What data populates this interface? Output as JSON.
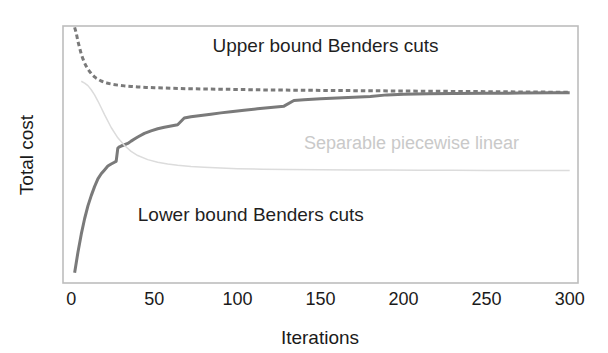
{
  "chart_data": {
    "type": "line",
    "title": "",
    "xlabel": "Iterations",
    "ylabel": "Total cost",
    "xlim": [
      -5,
      305
    ],
    "ylim": [
      0,
      100
    ],
    "xticks": [
      0,
      50,
      100,
      150,
      200,
      250,
      300
    ],
    "xtick_labels": [
      "0",
      "50",
      "100",
      "150",
      "200",
      "250",
      "300"
    ],
    "yticks": [],
    "ytick_labels": [],
    "grid": false,
    "legend": "none (inline annotations)",
    "frame": "box border, light gray",
    "annotations": [
      {
        "text": "Upper bound Benders cuts",
        "x": 85,
        "y": 90,
        "color": "#1f1f1f",
        "style": "dark"
      },
      {
        "text": "Separable piecewise linear",
        "x": 140,
        "y": 52,
        "color": "#c9c9c9",
        "style": "light"
      },
      {
        "text": "Lower bound Benders cuts",
        "x": 40,
        "y": 24,
        "color": "#1f1f1f",
        "style": "dark"
      }
    ],
    "series": [
      {
        "name": "Upper bound Benders cuts",
        "linestyle": "dashed",
        "color": "#7a7a7a",
        "linewidth": 3,
        "x": [
          2,
          3,
          4,
          5,
          6,
          7,
          8,
          9,
          10,
          11,
          12,
          13,
          14,
          15,
          16,
          18,
          20,
          22,
          25,
          28,
          32,
          36,
          40,
          45,
          50,
          60,
          70,
          80,
          90,
          100,
          120,
          140,
          160,
          180,
          200,
          220,
          240,
          260,
          280,
          300
        ],
        "y": [
          99.5,
          97.2,
          94.0,
          91.5,
          89.0,
          87.2,
          85.6,
          84.3,
          83.2,
          82.3,
          81.5,
          80.8,
          80.2,
          79.7,
          79.3,
          78.6,
          78.1,
          77.7,
          77.3,
          77.0,
          76.7,
          76.5,
          76.3,
          76.1,
          76.0,
          75.8,
          75.6,
          75.5,
          75.4,
          75.3,
          75.1,
          75.0,
          74.9,
          74.8,
          74.7,
          74.6,
          74.5,
          74.4,
          74.3,
          74.2
        ]
      },
      {
        "name": "Lower bound Benders cuts",
        "linestyle": "solid",
        "color": "#7a7a7a",
        "linewidth": 3,
        "x": [
          2,
          4,
          6,
          8,
          10,
          12,
          14,
          16,
          18,
          20,
          22,
          24,
          26,
          27,
          28,
          29,
          30,
          32,
          34,
          36,
          38,
          40,
          44,
          48,
          52,
          56,
          60,
          64,
          68,
          72,
          78,
          84,
          90,
          96,
          104,
          112,
          120,
          128,
          134,
          140,
          150,
          160,
          170,
          180,
          190,
          200,
          215,
          230,
          250,
          270,
          290,
          300
        ],
        "y": [
          4.0,
          12.0,
          19.0,
          25.0,
          30.0,
          34.0,
          37.5,
          40.5,
          42.5,
          44.0,
          45.5,
          46.3,
          47.0,
          47.3,
          52.5,
          53.0,
          53.3,
          53.8,
          54.3,
          55.2,
          56.0,
          56.8,
          58.2,
          59.2,
          60.0,
          60.6,
          61.1,
          61.6,
          64.2,
          64.7,
          65.2,
          65.7,
          66.2,
          66.6,
          67.2,
          67.8,
          68.3,
          68.8,
          71.0,
          71.3,
          71.7,
          72.0,
          72.3,
          72.6,
          73.2,
          73.4,
          73.6,
          73.7,
          73.8,
          73.9,
          74.0,
          74.0
        ]
      },
      {
        "name": "Separable piecewise linear",
        "linestyle": "solid",
        "color": "#dcdcdc",
        "linewidth": 1.5,
        "x": [
          6,
          8,
          10,
          12,
          14,
          16,
          18,
          20,
          24,
          28,
          32,
          36,
          40,
          46,
          52,
          58,
          64,
          72,
          80,
          90,
          100,
          115,
          130,
          150,
          170,
          190,
          210,
          230,
          250,
          270,
          290,
          300
        ],
        "y": [
          78.5,
          77.8,
          76.8,
          75.2,
          73.2,
          70.8,
          68.2,
          65.5,
          60.5,
          56.5,
          53.5,
          51.2,
          49.6,
          48.0,
          47.0,
          46.3,
          45.8,
          45.3,
          45.0,
          44.7,
          44.5,
          44.3,
          44.2,
          44.1,
          44.0,
          44.0,
          43.9,
          43.9,
          43.8,
          43.8,
          43.8,
          43.8
        ]
      }
    ]
  }
}
